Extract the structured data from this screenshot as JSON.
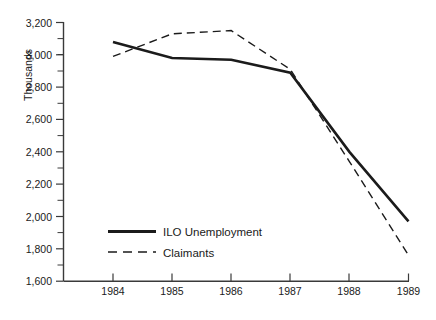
{
  "chart_data": {
    "type": "line",
    "title": "",
    "xlabel": "",
    "ylabel": "Thousands",
    "categories": [
      "1984",
      "1985",
      "1986",
      "1987",
      "1988",
      "1989"
    ],
    "x": [
      1984,
      1985,
      1986,
      1987,
      1988,
      1989
    ],
    "xlim": [
      1984,
      1989
    ],
    "ylim": [
      1600,
      3200
    ],
    "grid": false,
    "legend_position": "inside-bottom-left",
    "ytick_labels": [
      "3,200",
      "3,000",
      "2,800",
      "2,600",
      "2,400",
      "2,200",
      "2,000",
      "1,800",
      "1,600"
    ],
    "ytick_values": [
      3200,
      3000,
      2800,
      2600,
      2400,
      2200,
      2000,
      1800,
      1600
    ],
    "yminor_step": 100,
    "series": [
      {
        "name": "ILO Unemployment",
        "style": "solid",
        "values": [
          3080,
          2980,
          2970,
          2890,
          2400,
          1970
        ]
      },
      {
        "name": "Claimants",
        "style": "dashed",
        "values": [
          2990,
          3130,
          3150,
          2910,
          2340,
          1760
        ]
      }
    ],
    "legend": [
      {
        "label": "ILO Unemployment",
        "style": "solid"
      },
      {
        "label": "Claimants",
        "style": "dashed"
      }
    ],
    "colors": {
      "series_line": "#1b1b1b",
      "axis": "#3a3a3a",
      "text": "#1a1a1a",
      "background": "#ffffff"
    }
  }
}
